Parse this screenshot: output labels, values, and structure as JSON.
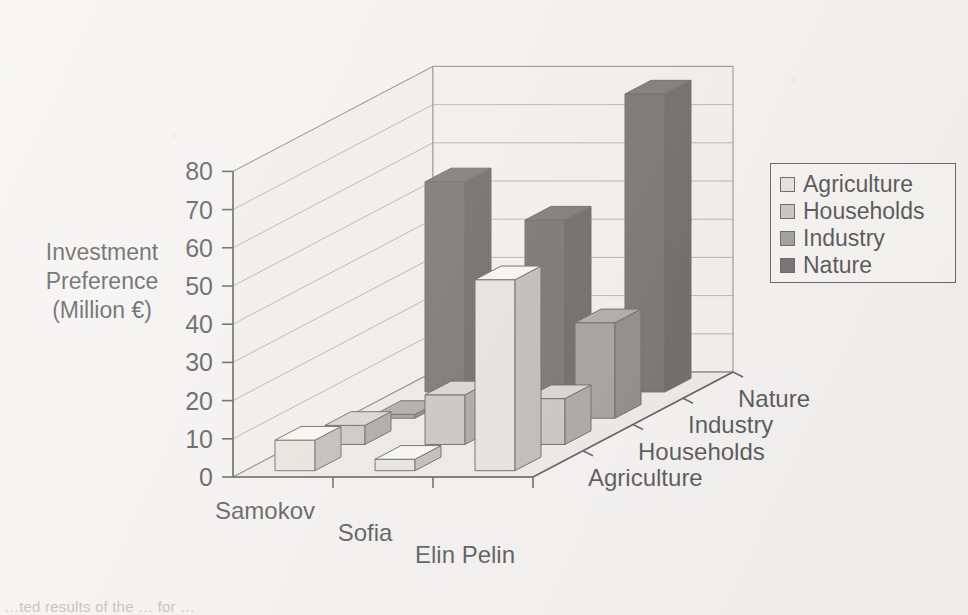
{
  "chart_data": {
    "type": "bar",
    "render": "3d-grouped-bar",
    "title": "",
    "xlabel": "",
    "ylabel": "Investment Preference (Million €)",
    "ylim": [
      0,
      80
    ],
    "ytick_step": 10,
    "yticks": [
      "0",
      "10",
      "20",
      "30",
      "40",
      "50",
      "60",
      "70",
      "80"
    ],
    "grid": true,
    "legend_position": "right",
    "categories": [
      "Samokov",
      "Sofia",
      "Elin Pelin"
    ],
    "depth_categories": [
      "Agriculture",
      "Households",
      "Industry",
      "Nature"
    ],
    "series": [
      {
        "name": "Agriculture",
        "color": "#dedcd6",
        "values": [
          8,
          3,
          50
        ]
      },
      {
        "name": "Households",
        "color": "#b4b2ac",
        "values": [
          5,
          13,
          12
        ]
      },
      {
        "name": "Industry",
        "color": "#7d7b76",
        "values": [
          1,
          10,
          25
        ]
      },
      {
        "name": "Nature",
        "color": "#3c3a37",
        "values": [
          55,
          45,
          78
        ]
      }
    ]
  },
  "ylabel_lines": {
    "line1": "Investment",
    "line2": "Preference",
    "line3": "(Million €)"
  },
  "legend": {
    "items": [
      {
        "label": "Agriculture",
        "color": "#dedcd6"
      },
      {
        "label": "Households",
        "color": "#b4b2ac"
      },
      {
        "label": "Industry",
        "color": "#7d7b76"
      },
      {
        "label": "Nature",
        "color": "#3c3a37"
      }
    ]
  },
  "caption": "…ted results of the … for …"
}
